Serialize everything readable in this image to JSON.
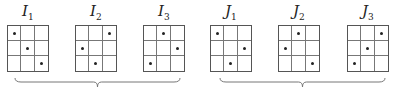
{
  "matrices": [
    {
      "name": "I",
      "sub": "1",
      "x": 7,
      "dots": [
        [
          0,
          0
        ],
        [
          1,
          1
        ],
        [
          2,
          2
        ]
      ]
    },
    {
      "name": "I",
      "sub": "2",
      "x": 75,
      "dots": [
        [
          0,
          2
        ],
        [
          1,
          0
        ],
        [
          2,
          1
        ]
      ]
    },
    {
      "name": "I",
      "sub": "3",
      "x": 143,
      "dots": [
        [
          0,
          1
        ],
        [
          1,
          2
        ],
        [
          2,
          0
        ]
      ]
    },
    {
      "name": "J",
      "sub": "1",
      "x": 210,
      "dots": [
        [
          0,
          0
        ],
        [
          1,
          2
        ],
        [
          2,
          1
        ]
      ]
    },
    {
      "name": "J",
      "sub": "2",
      "x": 278,
      "dots": [
        [
          0,
          1
        ],
        [
          1,
          0
        ],
        [
          2,
          2
        ]
      ]
    },
    {
      "name": "J",
      "sub": "3",
      "x": 347,
      "dots": [
        [
          0,
          2
        ],
        [
          1,
          1
        ],
        [
          2,
          0
        ]
      ]
    }
  ],
  "braces": [
    {
      "x1": 15,
      "x2": 180
    },
    {
      "x1": 220,
      "x2": 385
    }
  ]
}
